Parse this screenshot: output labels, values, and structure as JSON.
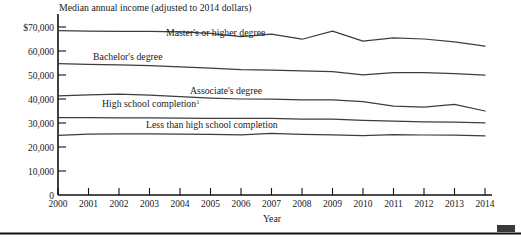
{
  "chart_data": {
    "type": "line",
    "title": "Median annual income (adjusted to 2014 dollars)",
    "xlabel": "Year",
    "ylabel": "",
    "grid": false,
    "legend_position": "inline-labels",
    "x": [
      2000,
      2001,
      2002,
      2003,
      2004,
      2005,
      2006,
      2007,
      2008,
      2009,
      2010,
      2011,
      2012,
      2013,
      2014
    ],
    "categories": [
      "2000",
      "2001",
      "2002",
      "2003",
      "2004",
      "2005",
      "2006",
      "2007",
      "2008",
      "2009",
      "2010",
      "2011",
      "2012",
      "2013",
      "2014"
    ],
    "xlim": [
      2000,
      2014
    ],
    "ylim": [
      0,
      70000
    ],
    "ytick_values": [
      0,
      10000,
      20000,
      30000,
      40000,
      50000,
      60000,
      70000
    ],
    "ytick_labels": [
      "0",
      "10,000",
      "20,000",
      "30,000",
      "40,000",
      "50,000",
      "60,000",
      "$70,000"
    ],
    "series": [
      {
        "name": "Master's or higher degree",
        "label": "Master's or higher degree",
        "values": [
          68500,
          68300,
          68200,
          68200,
          68000,
          67300,
          66000,
          67000,
          64900,
          68300,
          64100,
          65500,
          65000,
          63800,
          62000
        ]
      },
      {
        "name": "Bachelor's degree",
        "label": "Bachelor's degree",
        "values": [
          54700,
          54400,
          54200,
          53900,
          53400,
          52900,
          52200,
          52000,
          51700,
          51400,
          50100,
          51000,
          51000,
          50600,
          49900
        ]
      },
      {
        "name": "Associate's degree",
        "label": "Associate's degree",
        "values": [
          41300,
          41700,
          42000,
          41600,
          41000,
          40400,
          40000,
          39900,
          39600,
          39600,
          38900,
          37000,
          36600,
          37800,
          35000
        ]
      },
      {
        "name": "High school completion",
        "label": "High school completion",
        "label_superscript": "1",
        "values": [
          32200,
          32200,
          32100,
          32100,
          32000,
          31900,
          31900,
          31900,
          31600,
          31600,
          31100,
          30800,
          30500,
          30400,
          30100
        ]
      },
      {
        "name": "Less than high school completion",
        "label": "Less than high school completion",
        "values": [
          24800,
          25400,
          25500,
          25500,
          25400,
          25300,
          25100,
          25700,
          25300,
          25100,
          24700,
          25200,
          25000,
          24900,
          24600
        ]
      }
    ],
    "annotations": [
      {
        "text": "Master's or higher degree",
        "x": 2003.6,
        "y": 70400
      },
      {
        "text": "Bachelor's degree",
        "x": 2001.0,
        "y": 57200
      },
      {
        "text": "Associate's degree",
        "x": 2004.3,
        "y": 43600
      },
      {
        "text": "High school completion",
        "x": 2001.6,
        "y": 37900
      },
      {
        "text": "Less than high school completion",
        "x": 2003.3,
        "y": 30900
      }
    ]
  }
}
